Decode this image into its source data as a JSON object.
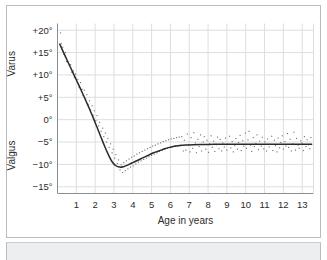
{
  "chart_data": {
    "type": "line",
    "title": "",
    "subtitle": "",
    "xlabel": "Age in years",
    "ylabel": "",
    "y_upper_label": "Varus",
    "y_lower_label": "Valgus",
    "xlim": [
      0,
      13.6
    ],
    "ylim": [
      -16.5,
      21.5
    ],
    "grid": true,
    "legend": "none",
    "x_ticks": [
      1,
      2,
      3,
      4,
      5,
      6,
      7,
      8,
      9,
      10,
      11,
      12,
      13
    ],
    "x_tick_labels": [
      "1",
      "2",
      "3",
      "4",
      "5",
      "6",
      "7",
      "8",
      "9",
      "10",
      "11",
      "12",
      "13"
    ],
    "y_ticks": [
      20,
      15,
      10,
      5,
      0,
      -5,
      -10,
      -15
    ],
    "y_tick_labels": [
      "+20°",
      "+15°",
      "+10°",
      "+5°",
      "0°",
      "−5°",
      "−10°",
      "−15°"
    ],
    "series": [
      {
        "name": "Mean tibiofemoral angle",
        "type": "line",
        "color": "#2a2a2a",
        "x": [
          0.12,
          0.3,
          0.5,
          0.7,
          0.9,
          1.1,
          1.3,
          1.5,
          1.7,
          1.9,
          2.1,
          2.3,
          2.5,
          2.7,
          2.9,
          3.1,
          3.3,
          3.5,
          3.7,
          3.9,
          4.1,
          4.3,
          4.5,
          4.7,
          4.9,
          5.1,
          5.3,
          5.5,
          5.7,
          5.9,
          6.1,
          6.3,
          6.5,
          6.8,
          7.2,
          7.6,
          8.0,
          8.5,
          9.0,
          9.5,
          10.0,
          10.5,
          11.0,
          11.5,
          12.0,
          12.5,
          13.0,
          13.5
        ],
        "y": [
          16.9,
          15.2,
          13.4,
          11.6,
          9.8,
          8.0,
          6.2,
          4.3,
          2.4,
          0.4,
          -1.7,
          -3.8,
          -5.9,
          -7.8,
          -9.4,
          -10.3,
          -10.6,
          -10.5,
          -10.2,
          -9.8,
          -9.4,
          -9.0,
          -8.6,
          -8.2,
          -7.8,
          -7.4,
          -7.1,
          -6.8,
          -6.5,
          -6.25,
          -6.05,
          -5.9,
          -5.78,
          -5.66,
          -5.58,
          -5.54,
          -5.52,
          -5.5,
          -5.5,
          -5.5,
          -5.5,
          -5.5,
          -5.5,
          -5.5,
          -5.5,
          -5.5,
          -5.5,
          -5.5
        ]
      },
      {
        "name": "Individual measurements",
        "type": "scatter",
        "color": "#6d6d6d",
        "points": [
          [
            0.16,
            19.4
          ],
          [
            0.2,
            17.0
          ],
          [
            0.28,
            16.2
          ],
          [
            0.34,
            14.6
          ],
          [
            0.42,
            15.0
          ],
          [
            0.48,
            13.0
          ],
          [
            0.55,
            12.9
          ],
          [
            0.62,
            12.1
          ],
          [
            0.7,
            12.3
          ],
          [
            0.76,
            10.6
          ],
          [
            0.84,
            10.9
          ],
          [
            0.9,
            9.4
          ],
          [
            0.96,
            10.2
          ],
          [
            1.02,
            8.6
          ],
          [
            1.08,
            9.0
          ],
          [
            1.15,
            7.2
          ],
          [
            1.22,
            8.3
          ],
          [
            1.3,
            6.8
          ],
          [
            1.36,
            5.4
          ],
          [
            1.42,
            6.6
          ],
          [
            1.5,
            4.6
          ],
          [
            1.56,
            5.6
          ],
          [
            1.62,
            3.4
          ],
          [
            1.7,
            4.2
          ],
          [
            1.76,
            2.2
          ],
          [
            1.84,
            3.1
          ],
          [
            1.9,
            1.0
          ],
          [
            1.96,
            2.0
          ],
          [
            2.04,
            -0.2
          ],
          [
            2.1,
            0.9
          ],
          [
            2.18,
            -1.4
          ],
          [
            2.24,
            -0.6
          ],
          [
            2.32,
            -2.6
          ],
          [
            2.4,
            -1.9
          ],
          [
            2.46,
            -3.8
          ],
          [
            2.54,
            -3.0
          ],
          [
            2.6,
            -5.0
          ],
          [
            2.68,
            -4.2
          ],
          [
            2.74,
            -6.2
          ],
          [
            2.82,
            -5.4
          ],
          [
            2.9,
            -7.4
          ],
          [
            2.96,
            -6.6
          ],
          [
            3.04,
            -8.6
          ],
          [
            3.1,
            -7.8
          ],
          [
            3.18,
            -9.8
          ],
          [
            3.24,
            -9.0
          ],
          [
            3.32,
            -11.2
          ],
          [
            3.38,
            -10.1
          ],
          [
            3.46,
            -11.8
          ],
          [
            3.52,
            -9.6
          ],
          [
            3.6,
            -11.4
          ],
          [
            3.66,
            -9.2
          ],
          [
            3.74,
            -11.0
          ],
          [
            3.8,
            -8.8
          ],
          [
            3.88,
            -10.6
          ],
          [
            3.94,
            -8.4
          ],
          [
            4.02,
            -10.3
          ],
          [
            4.08,
            -8.1
          ],
          [
            4.16,
            -9.9
          ],
          [
            4.22,
            -7.7
          ],
          [
            4.3,
            -9.5
          ],
          [
            4.36,
            -7.4
          ],
          [
            4.44,
            -9.2
          ],
          [
            4.5,
            -7.1
          ],
          [
            4.58,
            -8.9
          ],
          [
            4.64,
            -6.8
          ],
          [
            4.72,
            -8.6
          ],
          [
            4.78,
            -6.5
          ],
          [
            4.86,
            -8.3
          ],
          [
            4.92,
            -6.2
          ],
          [
            5.0,
            -8.0
          ],
          [
            5.06,
            -5.9
          ],
          [
            5.14,
            -7.7
          ],
          [
            5.2,
            -5.7
          ],
          [
            5.28,
            -7.4
          ],
          [
            5.34,
            -5.4
          ],
          [
            5.42,
            -7.1
          ],
          [
            5.48,
            -5.2
          ],
          [
            5.56,
            -6.9
          ],
          [
            5.62,
            -4.9
          ],
          [
            5.7,
            -6.6
          ],
          [
            5.76,
            -4.7
          ],
          [
            5.84,
            -6.4
          ],
          [
            5.9,
            -4.5
          ],
          [
            5.98,
            -6.2
          ],
          [
            6.04,
            -4.3
          ],
          [
            6.12,
            -6.0
          ],
          [
            6.18,
            -4.2
          ],
          [
            6.26,
            -5.9
          ],
          [
            6.32,
            -4.0
          ],
          [
            6.4,
            -5.8
          ],
          [
            6.46,
            -3.9
          ],
          [
            6.54,
            -5.7
          ],
          [
            6.6,
            -3.8
          ],
          [
            6.68,
            -7.0
          ],
          [
            6.74,
            -4.6
          ],
          [
            6.82,
            -6.8
          ],
          [
            6.9,
            -3.2
          ],
          [
            6.96,
            -5.6
          ],
          [
            7.04,
            -7.2
          ],
          [
            7.1,
            -4.0
          ],
          [
            7.18,
            -6.4
          ],
          [
            7.24,
            -2.9
          ],
          [
            7.32,
            -5.2
          ],
          [
            7.38,
            -7.4
          ],
          [
            7.46,
            -4.4
          ],
          [
            7.52,
            -6.0
          ],
          [
            7.6,
            -3.4
          ],
          [
            7.66,
            -7.0
          ],
          [
            7.74,
            -5.0
          ],
          [
            7.8,
            -3.8
          ],
          [
            7.88,
            -6.6
          ],
          [
            7.94,
            -4.6
          ],
          [
            8.02,
            -7.3
          ],
          [
            8.08,
            -5.4
          ],
          [
            8.16,
            -3.6
          ],
          [
            8.22,
            -6.2
          ],
          [
            8.3,
            -4.8
          ],
          [
            8.36,
            -7.1
          ],
          [
            8.44,
            -5.6
          ],
          [
            8.5,
            -3.9
          ],
          [
            8.58,
            -6.5
          ],
          [
            8.64,
            -4.4
          ],
          [
            8.72,
            -7.0
          ],
          [
            8.78,
            -5.2
          ],
          [
            8.86,
            -6.1
          ],
          [
            8.92,
            -4.1
          ],
          [
            9.0,
            -6.8
          ],
          [
            9.06,
            -5.5
          ],
          [
            9.14,
            -3.7
          ],
          [
            9.2,
            -6.3
          ],
          [
            9.28,
            -4.9
          ],
          [
            9.34,
            -7.2
          ],
          [
            9.42,
            -5.8
          ],
          [
            9.48,
            -4.2
          ],
          [
            9.56,
            -6.6
          ],
          [
            9.62,
            -5.1
          ],
          [
            9.7,
            -3.5
          ],
          [
            9.76,
            -6.9
          ],
          [
            9.84,
            -4.7
          ],
          [
            9.9,
            -5.9
          ],
          [
            9.98,
            -3.0
          ],
          [
            10.04,
            -6.4
          ],
          [
            10.12,
            -4.5
          ],
          [
            10.18,
            -2.6
          ],
          [
            10.26,
            -5.7
          ],
          [
            10.32,
            -7.1
          ],
          [
            10.4,
            -4.0
          ],
          [
            10.46,
            -6.0
          ],
          [
            10.54,
            -5.3
          ],
          [
            10.6,
            -3.4
          ],
          [
            10.68,
            -6.7
          ],
          [
            10.74,
            -4.8
          ],
          [
            10.82,
            -5.9
          ],
          [
            10.88,
            -3.9
          ],
          [
            10.96,
            -6.5
          ],
          [
            11.02,
            -5.0
          ],
          [
            11.1,
            -7.0
          ],
          [
            11.16,
            -4.3
          ],
          [
            11.24,
            -6.1
          ],
          [
            11.3,
            -5.5
          ],
          [
            11.38,
            -3.7
          ],
          [
            11.44,
            -6.9
          ],
          [
            11.52,
            -4.6
          ],
          [
            11.58,
            -5.8
          ],
          [
            11.66,
            -7.2
          ],
          [
            11.72,
            -4.1
          ],
          [
            11.8,
            -6.3
          ],
          [
            11.86,
            -5.1
          ],
          [
            11.94,
            -3.6
          ],
          [
            12.0,
            -6.6
          ],
          [
            12.08,
            -4.9
          ],
          [
            12.14,
            -5.9
          ],
          [
            12.22,
            -3.1
          ],
          [
            12.28,
            -6.2
          ],
          [
            12.36,
            -4.4
          ],
          [
            12.42,
            -7.0
          ],
          [
            12.5,
            -5.4
          ],
          [
            12.56,
            -2.8
          ],
          [
            12.64,
            -6.8
          ],
          [
            12.7,
            -4.2
          ],
          [
            12.78,
            -5.7
          ],
          [
            12.84,
            -6.4
          ],
          [
            12.92,
            -4.7
          ],
          [
            12.98,
            -5.2
          ],
          [
            13.06,
            -6.9
          ],
          [
            13.12,
            -3.8
          ],
          [
            13.2,
            -6.0
          ],
          [
            13.26,
            -4.5
          ],
          [
            13.34,
            -5.6
          ],
          [
            13.4,
            -6.5
          ],
          [
            13.46,
            -4.0
          ]
        ]
      }
    ]
  },
  "axes": {
    "x_title": "Age in years",
    "upper_region_label": "Varus",
    "lower_region_label": "Valgus"
  },
  "colors": {
    "curve": "#2a2a2a",
    "points": "#6d6d6d",
    "grid": "#dcdee1",
    "axis": "#8a8d91",
    "frame": "#b9bcc0",
    "band": "#eceef0",
    "text": "#2b2b2b"
  }
}
